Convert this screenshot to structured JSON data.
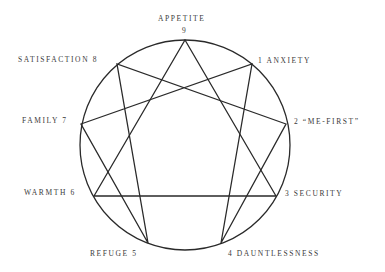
{
  "diagram": {
    "type": "enneagram",
    "circle": {
      "cx": 185,
      "cy": 145,
      "r": 105,
      "stroke": "#2a2a2a"
    },
    "points": [
      {
        "num": "9",
        "name": "APPETITE",
        "x": 185,
        "y": 40
      },
      {
        "num": "1",
        "name": "ANXIETY",
        "x": 252,
        "y": 64
      },
      {
        "num": "2",
        "name": "\"ME-FIRST\"",
        "x": 286,
        "y": 124
      },
      {
        "num": "3",
        "name": "SECURITY",
        "x": 276,
        "y": 196
      },
      {
        "num": "4",
        "name": "DAUNTLESSNESS",
        "x": 221,
        "y": 243
      },
      {
        "num": "5",
        "name": "REFUGE",
        "x": 148,
        "y": 243
      },
      {
        "num": "6",
        "name": "WARMTH",
        "x": 94,
        "y": 196
      },
      {
        "num": "7",
        "name": "FAMILY",
        "x": 81,
        "y": 124
      },
      {
        "num": "8",
        "name": "SATISFACTION",
        "x": 117,
        "y": 64
      }
    ],
    "triangle": [
      "9",
      "3",
      "6"
    ],
    "hexad": [
      "1",
      "4",
      "2",
      "8",
      "5",
      "7"
    ]
  },
  "labels": {
    "p9_name": "APPETITE",
    "p9_num": "9",
    "p1": "1 ANXIETY",
    "p2": "2 “ME-FIRST”",
    "p3": "3 SECURITY",
    "p4": "4 DAUNTLESSNESS",
    "p5": "REFUGE 5",
    "p6": "WARMTH 6",
    "p7": "FAMILY 7",
    "p8": "SATISFACTION 8"
  }
}
